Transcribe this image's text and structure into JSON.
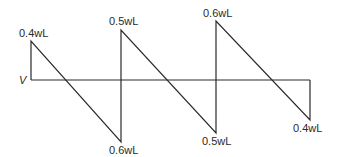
{
  "diagram": {
    "type": "shear-force-diagram",
    "axis_label": "V",
    "line_color": "#2a2a2a",
    "labels": {
      "peak1": "0.4wL",
      "peak2": "0.5wL",
      "peak3": "0.6wL",
      "trough1": "0.6wL",
      "trough2": "0.5wL",
      "trough3": "0.4wL"
    },
    "segments": [
      {
        "start": "+0.4wL",
        "end": "-0.6wL"
      },
      {
        "start": "+0.5wL",
        "end": "-0.5wL"
      },
      {
        "start": "+0.6wL",
        "end": "-0.4wL"
      }
    ]
  }
}
